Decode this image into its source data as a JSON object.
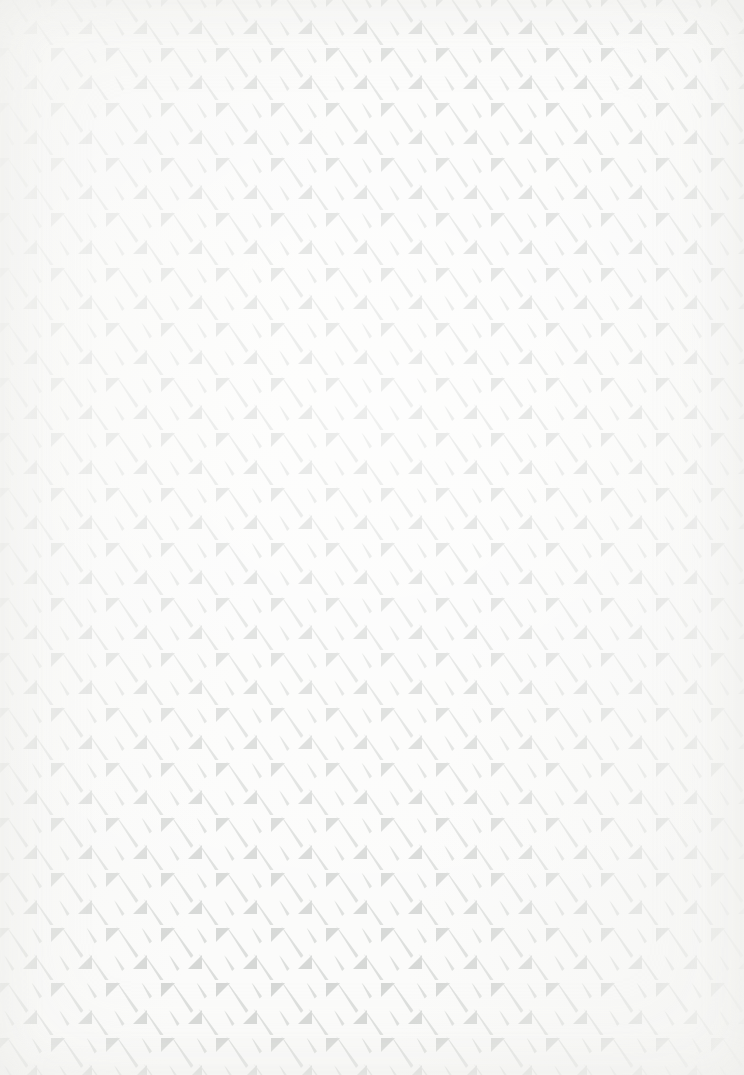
{
  "artwork": {
    "title": "Seamless Diagonal Triangle and Slash Pattern",
    "kind": "decorative-background-texture",
    "width_px": 744,
    "height_px": 1075,
    "background_color": "#fbfbfa",
    "motif_color": "#d5d7d5",
    "slash_color": "#dcdedc",
    "description": "Repeating tile of four light grey motifs: a down-pointing right triangle, a long diagonal slash, a short diagonal slash and an up-pointing right triangle, laid out on an offset grid over off-white paper."
  },
  "tile": {
    "width_px": 55,
    "height_px": 55,
    "columns": 14,
    "rows": 20,
    "motifs": [
      {
        "name": "down-triangle",
        "shape": "right-triangle",
        "orientation": "apex-down",
        "x": 4,
        "y": 3,
        "size": 14
      },
      {
        "name": "long-slash",
        "shape": "diagonal-bar",
        "orientation": "nw-se",
        "x": 13,
        "y": 2,
        "length": 30,
        "thickness": 3.4
      },
      {
        "name": "short-slash",
        "shape": "diagonal-bar",
        "orientation": "nw-se",
        "x": 33,
        "y": 4,
        "length": 14,
        "thickness": 3.2
      },
      {
        "name": "up-triangle",
        "shape": "right-triangle",
        "orientation": "apex-up",
        "x": 31,
        "y": 30,
        "size": 14
      },
      {
        "name": "long-slash-lower",
        "shape": "diagonal-bar",
        "orientation": "nw-se",
        "x": 3,
        "y": 29,
        "length": 30,
        "thickness": 3.4
      },
      {
        "name": "short-slash-lower",
        "shape": "diagonal-bar",
        "orientation": "nw-se",
        "x": 44,
        "y": 31,
        "length": 14,
        "thickness": 3.2
      }
    ]
  },
  "palette": {
    "paper": "#fbfbfa",
    "paper_warm_edge": "#f4f4f1",
    "motif_fill": "#d5d7d5",
    "motif_fill_soft": "#dcdedc",
    "highlight": "#ffffff"
  }
}
